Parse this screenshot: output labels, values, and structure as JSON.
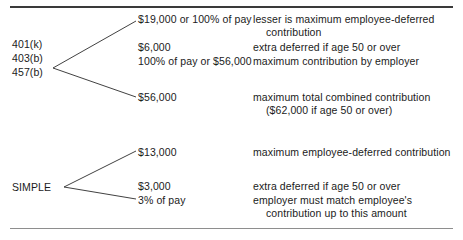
{
  "figure": {
    "background_color": "#ffffff",
    "text_color": "#1b1b1b",
    "rule_top_color": "#3a3a3a",
    "rule_bottom_color": "#8e8e8e"
  },
  "groups": [
    {
      "name": "qualified-plans",
      "labels": [
        "401(k)",
        "403(b)",
        "457(b)"
      ],
      "rows": [
        {
          "value": "$19,000 or 100% of pay",
          "descriptions": [
            "lesser is maximum employee-deferred",
            "contribution"
          ]
        },
        {
          "value": "$6,000",
          "descriptions": [
            "extra deferred if age 50 or over"
          ]
        },
        {
          "value": "100% of pay or $56,000",
          "descriptions": [
            "maximum contribution by employer"
          ]
        },
        {
          "value": "$56,000",
          "descriptions": [
            "maximum total combined contribution",
            "($62,000 if age 50 or over)"
          ]
        }
      ]
    },
    {
      "name": "simple-plan",
      "labels": [
        "SIMPLE"
      ],
      "rows": [
        {
          "value": "$13,000",
          "descriptions": [
            "maximum employee-deferred contribution"
          ]
        },
        {
          "value": "$3,000",
          "descriptions": [
            "extra deferred if age 50 or over"
          ]
        },
        {
          "value": "3% of pay",
          "descriptions": [
            "employer must match employee's",
            "contribution up to this amount"
          ]
        }
      ]
    }
  ],
  "text": {
    "label_401k": "401(k)",
    "label_403b": "403(b)",
    "label_457b": "457(b)",
    "label_simple": "SIMPLE",
    "v1": "$19,000 or 100% of pay",
    "v2": "$6,000",
    "v3": "100% of pay or $56,000",
    "v4": "$56,000",
    "v5": "$13,000",
    "v6": "$3,000",
    "v7": "3% of pay",
    "d1a": "lesser is maximum employee-deferred",
    "d1b": "contribution",
    "d2": "extra deferred if age 50 or over",
    "d3": "maximum contribution by employer",
    "d4a": "maximum total combined contribution",
    "d4b": "($62,000 if age 50 or over)",
    "d5": "maximum employee-deferred contribution",
    "d6": "extra deferred if age 50 or over",
    "d7a": "employer must match employee's",
    "d7b": "contribution up to this amount"
  }
}
